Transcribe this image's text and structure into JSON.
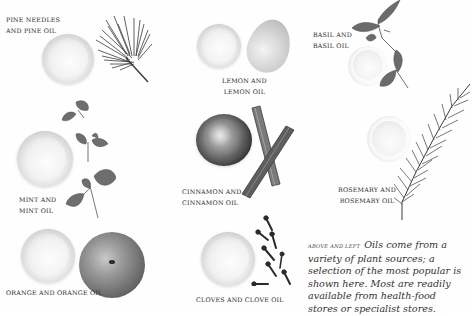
{
  "page": {
    "items": [
      {
        "id": "pine",
        "caption_lines": [
          "Pine needles",
          "and pine oil"
        ]
      },
      {
        "id": "lemon",
        "caption_lines": [
          "Lemon and",
          "lemon oil"
        ]
      },
      {
        "id": "basil",
        "caption_lines": [
          "Basil and",
          "basil oil"
        ]
      },
      {
        "id": "mint",
        "caption_lines": [
          "Mint and",
          "mint oil"
        ]
      },
      {
        "id": "cinnamon",
        "caption_lines": [
          "Cinnamon and",
          "cinnamon oil"
        ]
      },
      {
        "id": "rosemary",
        "caption_lines": [
          "Rosemary and",
          "rosemary oil"
        ]
      },
      {
        "id": "orange",
        "caption_lines": [
          "Orange and orange oil"
        ]
      },
      {
        "id": "cloves",
        "caption_lines": [
          "Cloves and clove oil"
        ]
      }
    ],
    "body": {
      "lead": "Above and left",
      "text": "Oils come from a variety of plant sources; a selection of the most popular is shown here. Most are readily available from health-food stores or specialist stores."
    }
  }
}
